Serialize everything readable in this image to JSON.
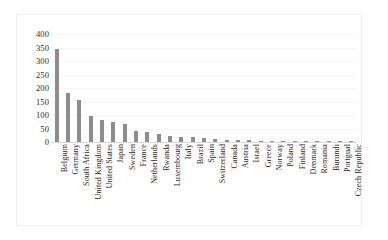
{
  "chart_data": {
    "type": "bar",
    "title": "",
    "subtitle": "",
    "xlabel": "",
    "ylabel": "",
    "ylim": [
      0,
      400
    ],
    "yticks": [
      400,
      350,
      300,
      250,
      200,
      150,
      100,
      50,
      0
    ],
    "grid": true,
    "legend": null,
    "bar_color": "#8d8d8d",
    "categories": [
      "Belgium",
      "Germany",
      "South Africa",
      "United Kingdom",
      "United States",
      "Japan",
      "Sweden",
      "France",
      "Netherlands",
      "Rwanda",
      "Luxembourg",
      "Italy",
      "Brazil",
      "Spain",
      "Switzerland",
      "Canada",
      "Austria",
      "Israel",
      "Greece",
      "Norway",
      "Poland",
      "Finland",
      "Denmark",
      "Romania",
      "Burundi",
      "Portgual",
      "Czech Republic"
    ],
    "values": [
      345,
      180,
      155,
      95,
      82,
      75,
      68,
      40,
      36,
      30,
      24,
      20,
      18,
      14,
      10,
      8,
      6,
      6,
      5,
      5,
      4,
      4,
      3,
      3,
      2,
      2,
      2
    ]
  }
}
